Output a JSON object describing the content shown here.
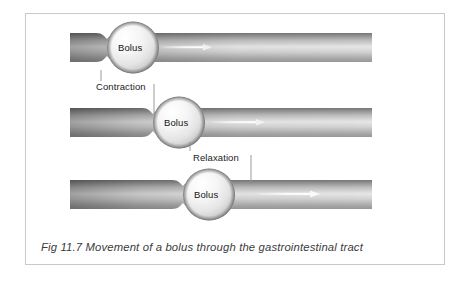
{
  "figure": {
    "caption": "Fig 11.7 Movement of a bolus through the gastrointestinal tract",
    "frame_border_color": "#c9c9c9",
    "background_color": "#ffffff"
  },
  "diagram": {
    "type": "peristalsis-sequence",
    "subject": "gastrointestinal tract",
    "stage_count": 3,
    "flow_direction": "left-to-right",
    "tube_colors": {
      "dark_edge": "#5a5a5a",
      "mid": "#d9d9d9",
      "light": "#f2f2f2",
      "bottom_edge": "#8c8c8c"
    },
    "bolus_colors": {
      "highlight": "#ffffff",
      "mid": "#ededed",
      "shadow": "#b8b8b8",
      "rim": "#6e6e6e"
    },
    "arrow_color": "#f7f7f7",
    "stages": [
      {
        "index": 1,
        "bolus_label": "Bolus",
        "bolus_position": "left",
        "has_arrow": true
      },
      {
        "index": 2,
        "bolus_label": "Bolus",
        "bolus_position": "center",
        "has_arrow": true
      },
      {
        "index": 3,
        "bolus_label": "Bolus",
        "bolus_position": "right",
        "has_arrow": true
      }
    ],
    "callouts": [
      {
        "label": "Contraction",
        "points_to": "constriction behind the bolus"
      },
      {
        "label": "Relaxation",
        "points_to": "dilated segment ahead of the bolus"
      }
    ],
    "leader_line_color": "#8f8f8f"
  }
}
